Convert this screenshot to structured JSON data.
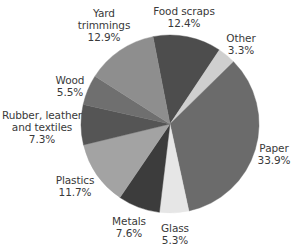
{
  "chart_data": {
    "type": "pie",
    "title": "",
    "start_angle_deg": -101,
    "direction": "clockwise",
    "center": [
      170,
      124
    ],
    "radius": 89,
    "slices": [
      {
        "label": "Food scraps",
        "value": 12.4,
        "pct_text": "12.4%",
        "color": "#4d4d4d",
        "label_pos": [
          184,
          5
        ],
        "label_lines": [
          "Food scraps"
        ]
      },
      {
        "label": "Other",
        "value": 3.3,
        "pct_text": "3.3%",
        "color": "#cfcfcf",
        "label_pos": [
          241,
          32
        ],
        "label_lines": [
          "Other"
        ]
      },
      {
        "label": "Paper",
        "value": 33.9,
        "pct_text": "33.9%",
        "color": "#6b6b6b",
        "label_pos": [
          274,
          142
        ],
        "label_lines": [
          "Paper"
        ]
      },
      {
        "label": "Glass",
        "value": 5.3,
        "pct_text": "5.3%",
        "color": "#e6e6e6",
        "label_pos": [
          175,
          222
        ],
        "label_lines": [
          "Glass"
        ]
      },
      {
        "label": "Metals",
        "value": 7.6,
        "pct_text": "7.6%",
        "color": "#3c3c3c",
        "label_pos": [
          129,
          215
        ],
        "label_lines": [
          "Metals"
        ]
      },
      {
        "label": "Plastics",
        "value": 11.7,
        "pct_text": "11.7%",
        "color": "#a3a3a3",
        "label_pos": [
          75,
          174
        ],
        "label_lines": [
          "Plastics"
        ]
      },
      {
        "label": "Rubber, leather and textiles",
        "value": 7.3,
        "pct_text": "7.3%",
        "color": "#555555",
        "label_pos": [
          42,
          109
        ],
        "label_lines": [
          "Rubber, leather",
          "and textiles"
        ]
      },
      {
        "label": "Wood",
        "value": 5.5,
        "pct_text": "5.5%",
        "color": "#6f6f6f",
        "label_pos": [
          70,
          74
        ],
        "label_lines": [
          "Wood"
        ]
      },
      {
        "label": "Yard trimmings",
        "value": 12.9,
        "pct_text": "12.9%",
        "color": "#8e8e8e",
        "label_pos": [
          104,
          7
        ],
        "label_lines": [
          "Yard",
          "trimmings"
        ]
      }
    ],
    "categories": [
      "Food scraps",
      "Other",
      "Paper",
      "Glass",
      "Metals",
      "Plastics",
      "Rubber, leather and textiles",
      "Wood",
      "Yard trimmings"
    ],
    "values": [
      12.4,
      3.3,
      33.9,
      5.3,
      7.6,
      11.7,
      7.3,
      5.5,
      12.9
    ],
    "legend": "none (direct labels)",
    "unit": "%"
  }
}
